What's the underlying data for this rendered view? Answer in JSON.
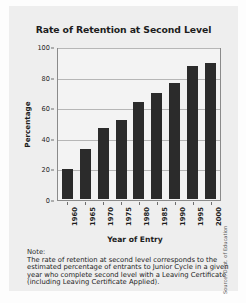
{
  "chart_data": {
    "type": "bar",
    "title": "Rate of Retention at Second Level",
    "xlabel": "Year of Entry",
    "ylabel": "Percentage",
    "categories": [
      "1960",
      "1965",
      "1970",
      "1975",
      "1980",
      "1985",
      "1990",
      "1995",
      "2000"
    ],
    "values": [
      20,
      33,
      47,
      52,
      64,
      70,
      77,
      88,
      90
    ],
    "yticks": [
      0,
      20,
      40,
      60,
      80,
      100
    ],
    "ylim": [
      0,
      100
    ],
    "grid": true,
    "legend": "none",
    "bar_color": "#2b2b2b",
    "plot_background": "#f3f3f3"
  },
  "note": {
    "heading": "Note:",
    "lines": [
      "The rate of retention at second level corresponds to the",
      "estimated percentage of entrants to Junior Cycle in a given",
      "year who complete second level with a Leaving Certificate",
      "(including Leaving Certificate Applied)."
    ]
  },
  "source": {
    "text": "Source: Dept. of Education"
  }
}
